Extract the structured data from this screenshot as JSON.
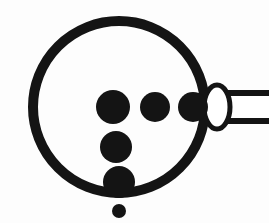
{
  "figure": {
    "caption": "",
    "width": 269,
    "height": 223,
    "background_color": "#fdfdfd",
    "ink_color": "#141414",
    "fill_white": "#ffffff"
  },
  "shapes": {
    "main_circle": {
      "label": "main-circle",
      "cx": 119,
      "cy": 107,
      "rx": 86,
      "ry": 86,
      "stroke_width": 10,
      "fill": "none"
    },
    "ellipse": {
      "label": "ellipse-outline",
      "cx": 217,
      "cy": 107,
      "rx": 13,
      "ry": 22,
      "stroke_width": 5,
      "fill": "#ffffff"
    },
    "stem": {
      "label": "horizontal-stem",
      "x": 217,
      "y_top": 93,
      "y_bottom": 121,
      "x_end": 269,
      "stroke_width": 6,
      "fill": "#ffffff"
    },
    "dots": [
      {
        "label": "dot-row-left",
        "cx": 113,
        "cy": 107,
        "r": 17
      },
      {
        "label": "dot-row-middle",
        "cx": 155,
        "cy": 107,
        "r": 15
      },
      {
        "label": "dot-row-right",
        "cx": 193,
        "cy": 107,
        "r": 15
      },
      {
        "label": "dot-column-mid",
        "cx": 116,
        "cy": 147,
        "r": 16
      },
      {
        "label": "dot-column-low",
        "cx": 119,
        "cy": 182,
        "r": 16
      },
      {
        "label": "dot-satellite",
        "cx": 119,
        "cy": 211,
        "r": 7
      }
    ]
  },
  "annotations": {
    "dot_count_label": "6",
    "row_dot_count": "3",
    "column_dot_count": "3"
  }
}
